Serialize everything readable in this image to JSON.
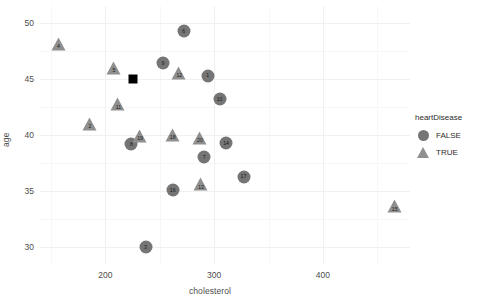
{
  "chart_data": {
    "type": "scatter",
    "title": "",
    "xlabel": "cholesterol",
    "ylabel": "age",
    "xlim": [
      140,
      480
    ],
    "ylim": [
      28.5,
      51.5
    ],
    "xticks": [
      200,
      300,
      400
    ],
    "yticks": [
      30,
      35,
      40,
      45,
      50
    ],
    "grid": true,
    "legend": {
      "title": "heartDisease",
      "position": "right",
      "entries": [
        {
          "label": "FALSE",
          "marker": "circle",
          "color": "#757575"
        },
        {
          "label": "TRUE",
          "marker": "triangle",
          "color": "#8f8f8f"
        }
      ]
    },
    "points": [
      {
        "id": "1",
        "cholesterol": 294,
        "age": 45.3,
        "heartDisease": "FALSE",
        "marker": "circle"
      },
      {
        "id": "2",
        "cholesterol": 186,
        "age": 41.0,
        "heartDisease": "TRUE",
        "marker": "triangle"
      },
      {
        "id": "3",
        "cholesterol": 237,
        "age": 30.0,
        "heartDisease": "FALSE",
        "marker": "circle"
      },
      {
        "id": "4",
        "cholesterol": 157,
        "age": 49.3,
        "heartDisease": "TRUE",
        "marker": "triangle"
      },
      {
        "id": "5",
        "cholesterol": 208,
        "age": 48.3,
        "heartDisease": "TRUE",
        "marker": "triangle"
      },
      {
        "id": "6",
        "cholesterol": 272,
        "age": 49.3,
        "heartDisease": "FALSE",
        "marker": "circle"
      },
      {
        "id": "7",
        "cholesterol": 291,
        "age": 38.0,
        "heartDisease": "FALSE",
        "marker": "circle"
      },
      {
        "id": "8",
        "cholesterol": 224,
        "age": 39.2,
        "heartDisease": "FALSE",
        "marker": "circle"
      },
      {
        "id": "9",
        "cholesterol": 253,
        "age": 46.4,
        "heartDisease": "FALSE",
        "marker": "circle"
      },
      {
        "id": "10",
        "cholesterol": 305,
        "age": 43.2,
        "heartDisease": "FALSE",
        "marker": "circle"
      },
      {
        "id": "11",
        "cholesterol": 212,
        "age": 46.2,
        "heartDisease": "TRUE",
        "marker": "triangle"
      },
      {
        "id": "12",
        "cholesterol": 268,
        "age": 50.2,
        "heartDisease": "TRUE",
        "marker": "triangle"
      },
      {
        "id": "13",
        "cholesterol": 288,
        "age": 41.4,
        "heartDisease": "TRUE",
        "marker": "triangle"
      },
      {
        "id": "14",
        "cholesterol": 311,
        "age": 39.3,
        "heartDisease": "FALSE",
        "marker": "circle"
      },
      {
        "id": "15",
        "cholesterol": 466,
        "age": 40.6,
        "heartDisease": "TRUE",
        "marker": "triangle"
      },
      {
        "id": "16",
        "cholesterol": 262,
        "age": 35.1,
        "heartDisease": "FALSE",
        "marker": "circle"
      },
      {
        "id": "17",
        "cholesterol": 327,
        "age": 36.3,
        "heartDisease": "FALSE",
        "marker": "circle"
      },
      {
        "id": "18",
        "cholesterol": 262,
        "age": 48.1,
        "heartDisease": "TRUE",
        "marker": "triangle"
      },
      {
        "id": "19",
        "cholesterol": 232,
        "age": 49.2,
        "heartDisease": "TRUE",
        "marker": "triangle"
      },
      {
        "id": "20",
        "cholesterol": 287,
        "age": 50.2,
        "heartDisease": "TRUE",
        "marker": "triangle"
      }
    ],
    "annotations": [
      {
        "name": "centroid-marker",
        "cholesterol": 225,
        "age": 45.0,
        "marker": "square",
        "color": "#000000"
      }
    ]
  }
}
